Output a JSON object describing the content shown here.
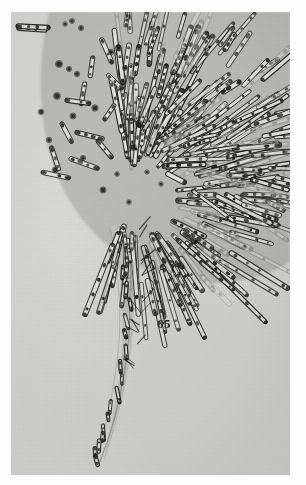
{
  "plate": {
    "figure_number": "65",
    "kind": "photomicrograph-plate",
    "print_background_color": "#d9d9d8",
    "paper_margin_color": "#fdfdfd",
    "ink_color": "#1b1b1b",
    "body_fill_color": "#b9b9b6",
    "subject": "rosette colony of rod-shaped bacteria radiating from a rounded host body with a tapering tail"
  },
  "chart_data": {
    "type": "scatter",
    "title": "65",
    "xlabel": "",
    "ylabel": "",
    "grid": false,
    "legend": null,
    "body": {
      "name": "host-body",
      "shape": "rounded-lobe",
      "center_x": 150,
      "center_y": 150,
      "radius_x": 118,
      "radius_y": 140,
      "fill": "#b9b9b6"
    },
    "tail": {
      "name": "tapering-tail",
      "points": [
        [
          128,
          230
        ],
        [
          132,
          300
        ],
        [
          124,
          365
        ],
        [
          108,
          420
        ],
        [
          96,
          452
        ]
      ],
      "width_start": 26,
      "width_end": 2
    },
    "cocci": [
      [
        54,
        12
      ],
      [
        61,
        9
      ],
      [
        70,
        16
      ],
      [
        48,
        52
      ],
      [
        58,
        57
      ],
      [
        66,
        62
      ],
      [
        100,
        40
      ],
      [
        114,
        56
      ],
      [
        128,
        112
      ],
      [
        122,
        135
      ],
      [
        106,
        162
      ],
      [
        38,
        128
      ],
      [
        44,
        158
      ],
      [
        62,
        104
      ],
      [
        84,
        96
      ],
      [
        136,
        160
      ],
      [
        150,
        172
      ],
      [
        72,
        146
      ],
      [
        92,
        178
      ],
      [
        118,
        190
      ],
      [
        46,
        84
      ],
      [
        30,
        100
      ]
    ],
    "rods_inner": [
      {
        "x": 6,
        "y": 16,
        "len": 30,
        "ang": 4,
        "w": 4.4,
        "segments": 4
      },
      {
        "x": 90,
        "y": 26,
        "len": 28,
        "ang": 66,
        "w": 4.4,
        "segments": 4
      },
      {
        "x": 82,
        "y": 44,
        "len": 22,
        "ang": 98,
        "w": 4.2,
        "segments": 3
      },
      {
        "x": 74,
        "y": 70,
        "len": 24,
        "ang": 100,
        "w": 4.2,
        "segments": 3
      },
      {
        "x": 54,
        "y": 88,
        "len": 26,
        "ang": 8,
        "w": 4.2,
        "segments": 4
      },
      {
        "x": 50,
        "y": 110,
        "len": 24,
        "ang": 62,
        "w": 4.2,
        "segments": 3
      },
      {
        "x": 64,
        "y": 120,
        "len": 30,
        "ang": 14,
        "w": 4.4,
        "segments": 4
      },
      {
        "x": 40,
        "y": 134,
        "len": 26,
        "ang": 72,
        "w": 4.2,
        "segments": 3
      },
      {
        "x": 58,
        "y": 146,
        "len": 32,
        "ang": 20,
        "w": 4.4,
        "segments": 4
      },
      {
        "x": 96,
        "y": 62,
        "len": 22,
        "ang": 44,
        "w": 4.0,
        "segments": 3
      },
      {
        "x": 104,
        "y": 92,
        "len": 20,
        "ang": 124,
        "w": 4.0,
        "segments": 3
      },
      {
        "x": 30,
        "y": 160,
        "len": 30,
        "ang": 12,
        "w": 4.4,
        "segments": 4
      },
      {
        "x": 86,
        "y": 128,
        "len": 24,
        "ang": 50,
        "w": 4.2,
        "segments": 3
      }
    ],
    "radial_filaments": {
      "origin_x": 120,
      "origin_y": 185,
      "count": 168,
      "angle_range_deg": [
        -96,
        108
      ],
      "length_range": [
        18,
        80
      ],
      "width_range": [
        3.2,
        5.2
      ]
    },
    "tail_bacteria_count": 18
  },
  "annotations": {
    "figure_label": "65"
  }
}
